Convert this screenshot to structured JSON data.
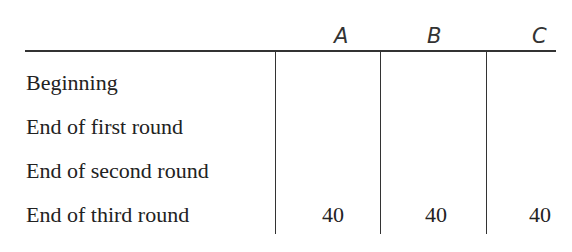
{
  "table": {
    "columns": [
      "A",
      "B",
      "C"
    ],
    "rows": [
      {
        "label": "Beginning",
        "values": [
          "",
          "",
          ""
        ]
      },
      {
        "label": "End of first round",
        "values": [
          "",
          "",
          ""
        ]
      },
      {
        "label": "End of second round",
        "values": [
          "",
          "",
          ""
        ]
      },
      {
        "label": "End of third round",
        "values": [
          "40",
          "40",
          "40"
        ]
      }
    ]
  }
}
